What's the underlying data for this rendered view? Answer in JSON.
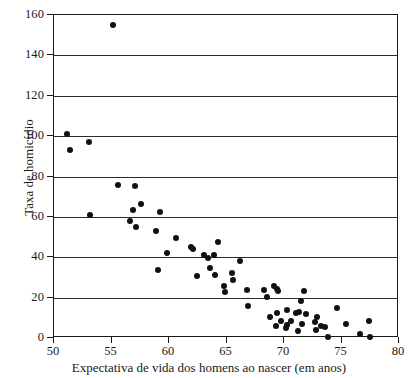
{
  "chart_data": {
    "type": "scatter",
    "title": "",
    "xlabel": "Expectativa de vida dos homens ao nascer (em anos)",
    "ylabel": "Taxa de homicídio",
    "xlim": [
      50,
      80
    ],
    "ylim": [
      0,
      160
    ],
    "xticks": [
      50,
      55,
      60,
      65,
      70,
      75,
      80
    ],
    "xtick_labels": [
      "50",
      "55",
      "60",
      "65",
      "70",
      "75",
      "80"
    ],
    "yticks": [
      0,
      20,
      40,
      60,
      80,
      100,
      120,
      140,
      160
    ],
    "ytick_labels": [
      "0",
      "20",
      "40",
      "60",
      "80",
      "100",
      "120",
      "140",
      "160"
    ],
    "gridlines": {
      "horizontal": [
        20,
        40,
        60,
        80,
        100,
        120,
        140
      ],
      "vertical": []
    },
    "grid": true,
    "legend": null,
    "marker": {
      "shape": "circle",
      "color": "#111111",
      "size": 6
    },
    "series": [
      {
        "name": "Países",
        "color": "#111111",
        "points": [
          [
            51.1,
            101.0
          ],
          [
            51.4,
            93.0
          ],
          [
            53.0,
            97.0
          ],
          [
            53.1,
            61.0
          ],
          [
            55.1,
            155.0
          ],
          [
            55.6,
            76.0
          ],
          [
            56.6,
            58.0
          ],
          [
            56.9,
            63.5
          ],
          [
            57.0,
            75.5
          ],
          [
            57.1,
            55.0
          ],
          [
            57.6,
            66.5
          ],
          [
            58.9,
            53.0
          ],
          [
            59.0,
            33.5
          ],
          [
            59.2,
            62.5
          ],
          [
            59.8,
            42.0
          ],
          [
            60.6,
            49.5
          ],
          [
            61.9,
            45.0
          ],
          [
            62.1,
            44.0
          ],
          [
            62.4,
            30.5
          ],
          [
            63.0,
            41.0
          ],
          [
            63.4,
            39.5
          ],
          [
            63.6,
            34.5
          ],
          [
            63.9,
            41.0
          ],
          [
            64.0,
            31.0
          ],
          [
            64.3,
            47.5
          ],
          [
            64.8,
            26.0
          ],
          [
            64.9,
            23.0
          ],
          [
            65.5,
            32.0
          ],
          [
            65.6,
            28.5
          ],
          [
            66.2,
            38.0
          ],
          [
            66.8,
            24.0
          ],
          [
            66.9,
            16.0
          ],
          [
            68.3,
            24.0
          ],
          [
            68.5,
            20.5
          ],
          [
            68.8,
            10.5
          ],
          [
            69.1,
            26.0
          ],
          [
            69.3,
            6.0
          ],
          [
            69.4,
            24.5
          ],
          [
            69.4,
            12.5
          ],
          [
            69.5,
            23.5
          ],
          [
            69.7,
            8.5
          ],
          [
            70.2,
            5.0
          ],
          [
            70.3,
            6.5
          ],
          [
            70.3,
            14.0
          ],
          [
            70.6,
            8.5
          ],
          [
            71.0,
            12.5
          ],
          [
            71.2,
            3.5
          ],
          [
            71.3,
            13.0
          ],
          [
            71.5,
            18.5
          ],
          [
            71.6,
            7.0
          ],
          [
            71.7,
            23.5
          ],
          [
            71.9,
            12.0
          ],
          [
            72.7,
            8.0
          ],
          [
            72.8,
            4.0
          ],
          [
            72.9,
            10.5
          ],
          [
            73.2,
            6.0
          ],
          [
            73.6,
            5.5
          ],
          [
            73.8,
            0.3
          ],
          [
            74.6,
            15.0
          ],
          [
            75.4,
            7.0
          ],
          [
            76.6,
            2.0
          ],
          [
            77.4,
            8.5
          ],
          [
            77.5,
            0.3
          ]
        ]
      }
    ],
    "point_count": 63
  }
}
